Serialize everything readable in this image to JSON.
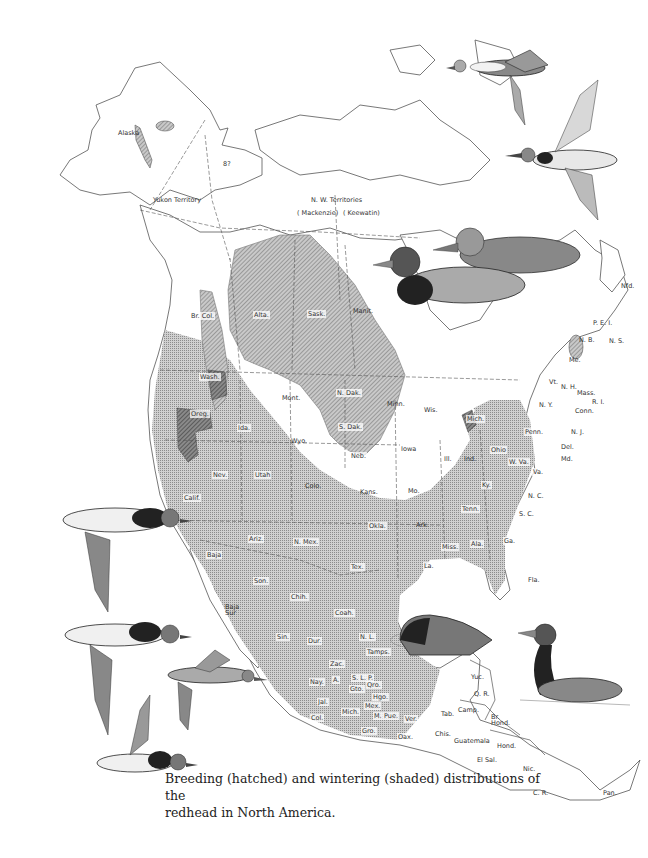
{
  "caption": {
    "line1": "Breeding (hatched) and wintering (shaded) distributions of the",
    "line2": "redhead in North America."
  },
  "legend": {
    "breeding": {
      "label": "Breeding",
      "pattern": "hatched",
      "color": "#9a9a9a"
    },
    "wintering": {
      "label": "Wintering",
      "pattern": "shaded",
      "color": "#b8b8b8"
    },
    "overlap": {
      "label": "Breeding + wintering overlap",
      "pattern": "dark hatched",
      "color": "#6e6e6e"
    }
  },
  "regions": {
    "alaska": "Alaska",
    "yukon": "Yukon Territory",
    "unknown_marker": "8?",
    "nwt": "N. W. Territories",
    "mackenzie": "( Mackenzie)",
    "keewatin": "( Keewatin)",
    "br_col": "Br. Col.",
    "alta": "Alta.",
    "sask": "Sask.",
    "manit": "Manit.",
    "nfld": "Nfd.",
    "pei": "P. E. I.",
    "nb": "N. B.",
    "ns": "N. S.",
    "me": "Me.",
    "vt": "Vt.",
    "nh": "N. H.",
    "mass": "Mass.",
    "ri": "R. I.",
    "conn": "Conn.",
    "ny": "N. Y.",
    "nj": "N. J.",
    "penn": "Penn.",
    "del": "Del.",
    "md": "Md.",
    "wash": "Wash.",
    "oreg": "Oreg.",
    "ida": "Ida.",
    "mont": "Mont.",
    "wyo": "Wyo.",
    "n_dak": "N. Dak.",
    "s_dak": "S. Dak.",
    "minn": "Minn.",
    "wis": "Wis.",
    "mich": "Mich.",
    "iowa": "Iowa",
    "neb": "Neb.",
    "ill": "Ill.",
    "ind": "Ind.",
    "ohio": "Ohio",
    "w_va": "W. Va.",
    "va": "Va.",
    "nev": "Nev.",
    "utah": "Utah",
    "colo": "Colo.",
    "kans": "Kans.",
    "mo": "Mo.",
    "ky": "Ky.",
    "nc": "N. C.",
    "tenn": "Tenn.",
    "sc": "S. C.",
    "calif": "Calif.",
    "ariz": "Ariz.",
    "n_mex": "N. Mex.",
    "okla": "Okla.",
    "ark": "Ark.",
    "tex": "Tex.",
    "miss": "Miss.",
    "ala": "Ala.",
    "ga": "Ga.",
    "la": "La.",
    "fla": "Fla.",
    "baja": "Baja",
    "baja_sur": "Baja Sur",
    "son": "Son.",
    "chih": "Chih.",
    "coah": "Coah.",
    "sin": "Sin.",
    "dur": "Dur.",
    "nl": "N. L.",
    "tamps": "Tamps.",
    "zac": "Zac.",
    "slp": "S. L. P.",
    "ags": "A.",
    "nay": "Nay.",
    "jal": "Jal.",
    "gto": "Gto.",
    "qro": "Qro.",
    "hgo": "Hgo.",
    "mex": "Mex.",
    "col": "Col.",
    "mich_mx": "Mich.",
    "mor": "M.",
    "pue": "Pue.",
    "ver": "Ver.",
    "gro": "Gro.",
    "oax": "Oax.",
    "tab": "Tab.",
    "camp": "Camp.",
    "yuc": "Yuc.",
    "qr": "Q. R.",
    "chis": "Chis.",
    "guatemala": "Guatemala",
    "br_hond": "Br. Hond.",
    "hond": "Hond.",
    "el_sal": "El Sal.",
    "nic": "Nic.",
    "cr": "C. R.",
    "pan": "Pan."
  },
  "illustrations": [
    {
      "id": "flying-pair-top-right",
      "subject": "two redheads in flight"
    },
    {
      "id": "swimming-pair",
      "subject": "male and female redhead swimming"
    },
    {
      "id": "flying-group-left",
      "subject": "four redheads in flight"
    },
    {
      "id": "resting-duck",
      "subject": "redhead resting on water"
    },
    {
      "id": "swimming-male",
      "subject": "male redhead swimming"
    }
  ]
}
